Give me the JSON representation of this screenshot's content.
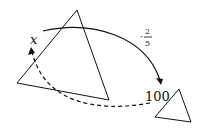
{
  "diagram": {
    "start_label": "x",
    "end_label": "100",
    "operation": {
      "dot": "·",
      "numerator": "2",
      "denominator": "5"
    },
    "colors": {
      "stroke": "#111111",
      "background": "#ffffff"
    }
  }
}
